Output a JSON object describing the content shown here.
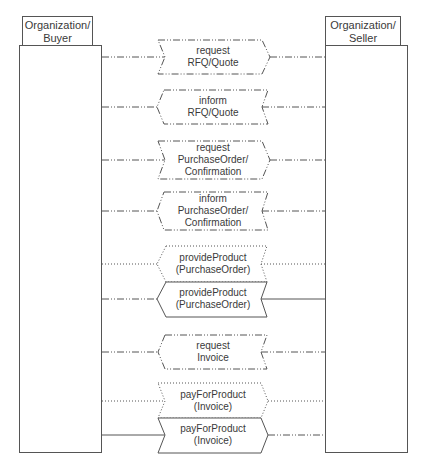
{
  "parties": {
    "buyer": {
      "label_line1": "Organization/",
      "label_line2": "Buyer"
    },
    "seller": {
      "label_line1": "Organization/",
      "label_line2": "Seller"
    }
  },
  "messages": [
    {
      "name": "request-rfq-quote",
      "line1": "request",
      "line2": "RFQ/Quote",
      "line3": "",
      "direction": "buyer-to-seller",
      "style": "dash-dot"
    },
    {
      "name": "inform-rfq-quote",
      "line1": "inform",
      "line2": "RFQ/Quote",
      "line3": "",
      "direction": "seller-to-buyer",
      "style": "dash-dot"
    },
    {
      "name": "request-purchaseorder-confirmation",
      "line1": "request",
      "line2": "PurchaseOrder/",
      "line3": "Confirmation",
      "direction": "buyer-to-seller",
      "style": "dash-dot"
    },
    {
      "name": "inform-purchaseorder-confirmation",
      "line1": "inform",
      "line2": "PurchaseOrder/",
      "line3": "Confirmation",
      "direction": "seller-to-buyer",
      "style": "dash-dot"
    },
    {
      "name": "provideproduct-purchaseorder-dotted",
      "line1": "provideProduct",
      "line2": "(PurchaseOrder)",
      "line3": "",
      "direction": "seller-to-buyer",
      "style": "dotted"
    },
    {
      "name": "provideproduct-purchaseorder-solid",
      "line1": "provideProduct",
      "line2": "(PurchaseOrder)",
      "line3": "",
      "direction": "seller-to-buyer",
      "style": "solid"
    },
    {
      "name": "request-invoice",
      "line1": "request",
      "line2": "Invoice",
      "line3": "",
      "direction": "seller-to-buyer",
      "style": "dash-dot"
    },
    {
      "name": "payforproduct-invoice-dotted",
      "line1": "payForProduct",
      "line2": "(Invoice)",
      "line3": "",
      "direction": "buyer-to-seller",
      "style": "dotted"
    },
    {
      "name": "payforproduct-invoice-solid",
      "line1": "payForProduct",
      "line2": "(Invoice)",
      "line3": "",
      "direction": "buyer-to-seller",
      "style": "solid"
    }
  ],
  "colors": {
    "stroke": "#555555",
    "text": "#3a3a3a",
    "background": "#ffffff"
  }
}
